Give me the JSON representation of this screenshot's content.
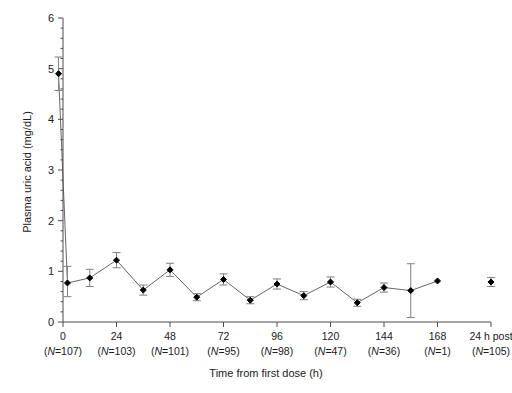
{
  "figure": {
    "axis_color": "#4d4d4d",
    "marker_color": "#000000",
    "line_color": "#555555",
    "error_color": "#808080"
  },
  "chart_data": {
    "type": "line",
    "title": "",
    "xlabel": "Time from first dose (h)",
    "ylabel": "Plasma uric acid (mg/dL)",
    "xlim": [
      -4,
      192
    ],
    "ylim": [
      0,
      6
    ],
    "yticks": [
      0,
      1,
      2,
      3,
      4,
      5,
      6
    ],
    "ytick_labels": [
      "0",
      "1",
      "2",
      "3",
      "4",
      "5",
      "6"
    ],
    "minor_ticks": true,
    "grid": false,
    "legend": null,
    "xticks": [
      0,
      24,
      48,
      72,
      96,
      120,
      144,
      168,
      192
    ],
    "xtick_labels": [
      "0",
      "24",
      "48",
      "72",
      "96",
      "120",
      "144",
      "168",
      "24 h post"
    ],
    "n_labels": [
      "(N=107)",
      "(N=103)",
      "(N=101)",
      "(N=95)",
      "(N=98)",
      "(N=47)",
      "(N=36)",
      "(N=1)",
      "(N=105)"
    ],
    "series": [
      {
        "name": "Plasma uric acid (mean ± SD)",
        "connected": true,
        "x": [
          -2,
          2,
          12,
          24,
          36,
          48,
          60,
          72,
          84,
          96,
          108,
          120,
          132,
          144,
          156,
          168
        ],
        "y": [
          4.9,
          0.77,
          0.87,
          1.22,
          0.63,
          1.03,
          0.49,
          0.84,
          0.43,
          0.75,
          0.52,
          0.79,
          0.38,
          0.68,
          0.62,
          0.81
        ],
        "err_low": [
          0.33,
          0.27,
          0.17,
          0.15,
          0.1,
          0.13,
          0.07,
          0.11,
          0.07,
          0.1,
          0.08,
          0.1,
          0.07,
          0.09,
          0.53,
          0.0
        ],
        "err_high": [
          0.33,
          0.33,
          0.17,
          0.15,
          0.1,
          0.13,
          0.07,
          0.11,
          0.07,
          0.1,
          0.08,
          0.1,
          0.07,
          0.09,
          0.53,
          0.0
        ]
      },
      {
        "name": "24 h post dose",
        "connected": false,
        "x": [
          192
        ],
        "y": [
          0.79
        ],
        "err_low": [
          0.09
        ],
        "err_high": [
          0.09
        ]
      }
    ]
  }
}
